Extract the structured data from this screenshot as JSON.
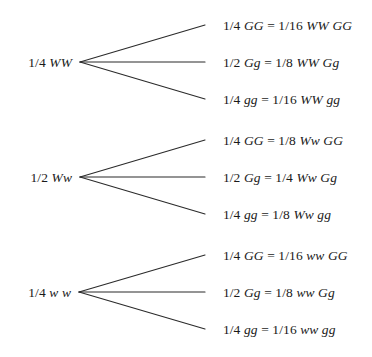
{
  "diagram": {
    "kind": "probability-tree",
    "colors": {
      "background": "#ffffff",
      "line": "#2b2b2b",
      "text": "#1a1a1a"
    },
    "groups": [
      {
        "id": "group-ww-dominant",
        "parent": {
          "fraction": "1/4",
          "genotype": "WW",
          "text": "1/4 WW"
        },
        "branches": [
          {
            "fraction": "1/4",
            "genotype": "GG",
            "equals": "=",
            "result_fraction": "1/16",
            "result_genotype": "WW GG",
            "text": "1/4 GG = 1/16 WW GG"
          },
          {
            "fraction": "1/2",
            "genotype": "Gg",
            "equals": "=",
            "result_fraction": "1/8",
            "result_genotype": "WW Gg",
            "text": "1/2 Gg = 1/8 WW Gg"
          },
          {
            "fraction": "1/4",
            "genotype": "gg",
            "equals": "=",
            "result_fraction": "1/16",
            "result_genotype": "WW gg",
            "text": "1/4 gg = 1/16 WW gg"
          }
        ]
      },
      {
        "id": "group-ww-heterozygous",
        "parent": {
          "fraction": "1/2",
          "genotype": "Ww",
          "text": "1/2 Ww"
        },
        "branches": [
          {
            "fraction": "1/4",
            "genotype": "GG",
            "equals": "=",
            "result_fraction": "1/8",
            "result_genotype": "Ww GG",
            "text": "1/4 GG = 1/8 Ww GG"
          },
          {
            "fraction": "1/2",
            "genotype": "Gg",
            "equals": "=",
            "result_fraction": "1/4",
            "result_genotype": "Ww Gg",
            "text": "1/2 Gg = 1/4 Ww Gg"
          },
          {
            "fraction": "1/4",
            "genotype": "gg",
            "equals": "=",
            "result_fraction": "1/8",
            "result_genotype": "Ww gg",
            "text": "1/4 gg = 1/8 Ww gg"
          }
        ]
      },
      {
        "id": "group-ww-recessive",
        "parent": {
          "fraction": "1/4",
          "genotype": "w w",
          "text": "1/4 w w"
        },
        "branches": [
          {
            "fraction": "1/4",
            "genotype": "GG",
            "equals": "=",
            "result_fraction": "1/16",
            "result_genotype": "ww GG",
            "text": "1/4 GG = 1/16 ww GG"
          },
          {
            "fraction": "1/2",
            "genotype": "Gg",
            "equals": "=",
            "result_fraction": "1/8",
            "result_genotype": "ww Gg",
            "text": "1/2 Gg = 1/8 ww Gg"
          },
          {
            "fraction": "1/4",
            "genotype": "gg",
            "equals": "=",
            "result_fraction": "1/16",
            "result_genotype": "ww gg",
            "text": "1/4 gg = 1/16 ww gg"
          }
        ]
      }
    ]
  }
}
